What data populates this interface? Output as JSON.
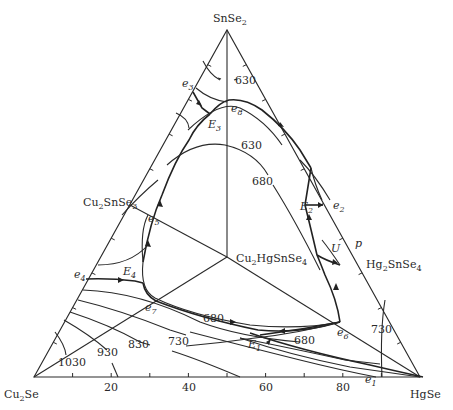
{
  "diagram": {
    "type": "ternary_phase_diagram",
    "vertices": {
      "top": "SnSe2",
      "bottom_left": "Cu2Se",
      "bottom_right": "HgSe"
    },
    "compounds": {
      "center": "Cu2HgSnSe4",
      "left_edge": "Cu2SnSe3",
      "right_edge": "Hg2SnSe4"
    },
    "axis_ticks": [
      "20",
      "40",
      "60",
      "80"
    ],
    "points": {
      "e1": "e1",
      "e2": "e2",
      "e3": "e3",
      "e4": "e4",
      "e5": "e5",
      "e6": "e6",
      "e7": "e7",
      "e8": "e8",
      "E1": "E1",
      "E2": "E2",
      "E3": "E3",
      "E4": "E4",
      "U": "U",
      "p": "p"
    },
    "isotherms": {
      "top_630": "630",
      "mid_630": "630",
      "mid_680": "680",
      "low_680_a": "680",
      "low_680_b": "680",
      "low_730": "730",
      "low_830": "830",
      "low_930": "930",
      "low_1030": "1030",
      "right_730": "730"
    }
  }
}
